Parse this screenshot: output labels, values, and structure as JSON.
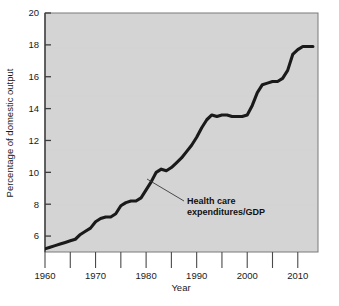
{
  "chart_data": {
    "type": "line",
    "title": "",
    "xlabel": "Year",
    "ylabel": "Percentage of domestic output",
    "xlim": [
      1960,
      2014
    ],
    "ylim": [
      5,
      20
    ],
    "ytick_labels": [
      "20",
      "18",
      "16",
      "14",
      "12",
      "10",
      "8",
      "6"
    ],
    "ytick_values": [
      20,
      18,
      16,
      14,
      12,
      10,
      8,
      6
    ],
    "xtick_labels": [
      "1960",
      "1970",
      "1980",
      "1990",
      "2000",
      "2010"
    ],
    "xtick_values": [
      1960,
      1970,
      1980,
      1990,
      2000,
      2010
    ],
    "xminor_ticks": [
      1965,
      1975,
      1985,
      1995,
      2005
    ],
    "grid": false,
    "legend_position": "none",
    "axis_break": "wavy-band-below-baseline",
    "series": [
      {
        "name": "Health care expenditures/GDP",
        "x": [
          1960,
          1961,
          1962,
          1963,
          1964,
          1965,
          1966,
          1967,
          1968,
          1969,
          1970,
          1971,
          1972,
          1973,
          1974,
          1975,
          1976,
          1977,
          1978,
          1979,
          1980,
          1981,
          1982,
          1983,
          1984,
          1985,
          1986,
          1987,
          1988,
          1989,
          1990,
          1991,
          1992,
          1993,
          1994,
          1995,
          1996,
          1997,
          1998,
          1999,
          2000,
          2001,
          2002,
          2003,
          2004,
          2005,
          2006,
          2007,
          2008,
          2009,
          2010,
          2011,
          2012,
          2013
        ],
        "values": [
          5.2,
          5.3,
          5.4,
          5.5,
          5.6,
          5.7,
          5.8,
          6.1,
          6.3,
          6.5,
          6.9,
          7.1,
          7.2,
          7.2,
          7.4,
          7.9,
          8.1,
          8.2,
          8.2,
          8.4,
          8.9,
          9.4,
          10.0,
          10.2,
          10.1,
          10.3,
          10.6,
          10.9,
          11.3,
          11.7,
          12.2,
          12.8,
          13.3,
          13.6,
          13.5,
          13.6,
          13.6,
          13.5,
          13.5,
          13.5,
          13.6,
          14.2,
          15.0,
          15.5,
          15.6,
          15.7,
          15.7,
          15.9,
          16.4,
          17.4,
          17.7,
          17.9,
          17.9,
          17.9
        ]
      }
    ],
    "annotation": {
      "label_line1": "Health care",
      "label_line2": "expenditures/GDP",
      "points_to_year": 1979,
      "points_to_value": 8.6
    },
    "colors": {
      "plot_background": "#d4d4d4",
      "line": "#1a1a1a",
      "axis": "#555555",
      "text": "#111111",
      "break_band": "#ffffff"
    }
  }
}
